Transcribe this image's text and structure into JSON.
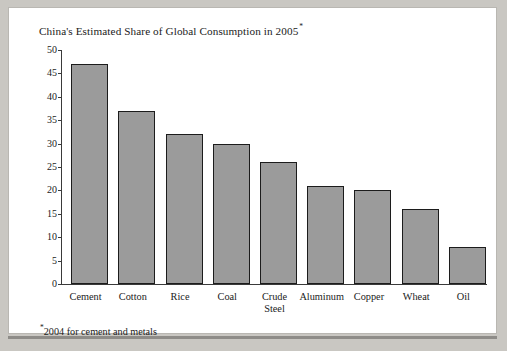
{
  "figure": {
    "title_text": "China's Estimated Share of Global Consumption in 2005",
    "title_superscript": "*",
    "footnote_superscript": "*",
    "footnote_text": "2004 for cement and metals",
    "colors": {
      "bar_fill": "#9b9b9b",
      "bar_border": "#1c1c1c",
      "axis": "#3a3a3a",
      "text": "#1b1b1b",
      "card_background": "#ffffff",
      "frame_background": "#c9c7c2",
      "shadow": "#8e8c88"
    }
  },
  "chart_data": {
    "type": "bar",
    "title": "China's Estimated Share of Global Consumption in 2005*",
    "xlabel": "",
    "ylabel": "",
    "ylim": [
      0,
      50
    ],
    "yticks": [
      0,
      5,
      10,
      15,
      20,
      25,
      30,
      35,
      40,
      45,
      50
    ],
    "ytick_labels": [
      "0",
      "5",
      "10",
      "15",
      "20",
      "25",
      "30",
      "35",
      "40",
      "45",
      "50"
    ],
    "grid": false,
    "legend": null,
    "annotations": [
      "*2004 for cement and metals"
    ],
    "categories": [
      "Cement",
      "Cotton",
      "Rice",
      "Coal",
      "Crude Steel",
      "Aluminum",
      "Copper",
      "Wheat",
      "Oil"
    ],
    "category_lines": [
      [
        "Cement"
      ],
      [
        "Cotton"
      ],
      [
        "Rice"
      ],
      [
        "Coal"
      ],
      [
        "Crude",
        "Steel"
      ],
      [
        "Aluminum"
      ],
      [
        "Copper"
      ],
      [
        "Wheat"
      ],
      [
        "Oil"
      ]
    ],
    "values": [
      47,
      37,
      32,
      30,
      26,
      21,
      20,
      16,
      8
    ]
  }
}
